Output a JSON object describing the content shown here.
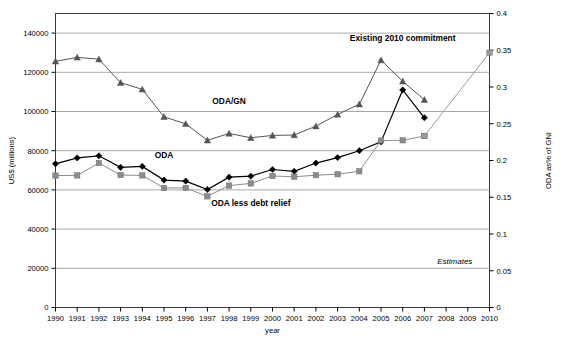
{
  "chart_data": {
    "type": "line",
    "title": "",
    "xlabel": "year",
    "ylabel": "US$ (millions)",
    "y2label": "ODA as% of GNI",
    "grid": true,
    "legend": "inline-annotations",
    "xlim": [
      1990,
      2010
    ],
    "ylim": [
      0,
      150000
    ],
    "y2lim": [
      0,
      0.4
    ],
    "categories": [
      1990,
      1991,
      1992,
      1993,
      1994,
      1995,
      1996,
      1997,
      1998,
      1999,
      2000,
      2001,
      2002,
      2003,
      2004,
      2005,
      2006,
      2007,
      2008,
      2009,
      2010
    ],
    "ytick_labels": [
      "0",
      "20000",
      "40000",
      "60000",
      "80000",
      "100000",
      "120000",
      "140000"
    ],
    "ytick_values": [
      0,
      20000,
      40000,
      60000,
      80000,
      100000,
      120000,
      140000
    ],
    "y2tick_labels": [
      "0",
      "0.05",
      "0.1",
      "0.15",
      "0.2",
      "0.25",
      "0.3",
      "0.35",
      "0.4"
    ],
    "y2tick_values": [
      0,
      0.05,
      0.1,
      0.15,
      0.2,
      0.25,
      0.3,
      0.35,
      0.4
    ],
    "xtick_labels": [
      "1990",
      "1991",
      "1992",
      "1993",
      "1994",
      "1995",
      "1996",
      "1997",
      "1998",
      "1999",
      "2000",
      "2001",
      "2002",
      "2003",
      "2004",
      "2005",
      "2006",
      "2007",
      "2008",
      "2009",
      "2010"
    ],
    "series": [
      {
        "name": "ODA/GN",
        "marker": "triangle",
        "color": "#555555",
        "axis": "left",
        "x": [
          1990,
          1991,
          1992,
          1993,
          1994,
          1995,
          1996,
          1997,
          1998,
          1999,
          2000,
          2001,
          2002,
          2003,
          2004,
          2005,
          2006,
          2007
        ],
        "values": [
          125600,
          127600,
          126700,
          114700,
          111300,
          97300,
          93700,
          85300,
          88800,
          86600,
          87800,
          88000,
          92500,
          98500,
          103700,
          126200,
          115400,
          106000
        ]
      },
      {
        "name": "ODA",
        "marker": "diamond",
        "color": "#000000",
        "axis": "left",
        "x": [
          1990,
          1991,
          1992,
          1993,
          1994,
          1995,
          1996,
          1997,
          1998,
          1999,
          2000,
          2001,
          2002,
          2003,
          2004,
          2005,
          2006,
          2007
        ],
        "values": [
          73300,
          76300,
          77400,
          71500,
          72000,
          65000,
          64500,
          60200,
          66500,
          67000,
          70400,
          69500,
          73700,
          76500,
          80000,
          84500,
          111000,
          96800
        ]
      },
      {
        "name": "ODA less debt relief",
        "marker": "square",
        "color": "#8c8c8c",
        "axis": "left",
        "x": [
          1990,
          1991,
          1992,
          1993,
          1994,
          1995,
          1996,
          1997,
          1998,
          1999,
          2000,
          2001,
          2002,
          2003,
          2004,
          2005,
          2006,
          2007
        ],
        "values": [
          67300,
          67400,
          73700,
          67600,
          67400,
          61000,
          61000,
          56700,
          62200,
          63300,
          67100,
          66700,
          67500,
          68000,
          69500,
          85200,
          85300,
          87500
        ]
      },
      {
        "name": "Existing 2010 commitment",
        "marker": "square",
        "color": "#9a9a9a",
        "axis": "left",
        "x": [
          2007,
          2010
        ],
        "values": [
          87500,
          130000
        ]
      }
    ],
    "annotations": [
      {
        "text": "ODA/GN",
        "x": 1998,
        "y": 104000
      },
      {
        "text": "ODA",
        "x": 1995,
        "y": 76500
      },
      {
        "text": "ODA less debt relief",
        "x": 1999,
        "y": 52000
      },
      {
        "text": "Existing 2010 commitment",
        "x": 2006,
        "y": 136000
      },
      {
        "text": "Estimates",
        "x": 2008.4,
        "y": 22000,
        "style": "italic"
      }
    ]
  }
}
